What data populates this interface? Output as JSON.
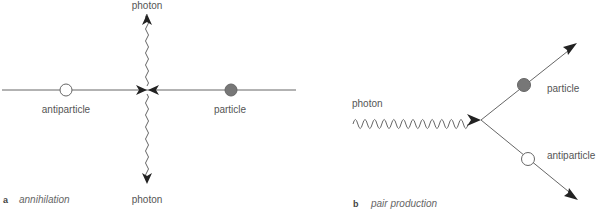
{
  "panels": [
    {
      "id": "a",
      "letter": "a",
      "caption": "annihilation",
      "labels": {
        "photon_top": "photon",
        "photon_bottom": "photon",
        "antiparticle": "antiparticle",
        "particle": "particle"
      },
      "particles": [
        {
          "name": "antiparticle",
          "fill": "#ffffff"
        },
        {
          "name": "particle",
          "fill": "#777777"
        }
      ]
    },
    {
      "id": "b",
      "letter": "b",
      "caption": "pair production",
      "labels": {
        "photon": "photon",
        "particle": "particle",
        "antiparticle": "antiparticle"
      },
      "particles": [
        {
          "name": "particle",
          "fill": "#777777"
        },
        {
          "name": "antiparticle",
          "fill": "#ffffff"
        }
      ]
    }
  ],
  "colors": {
    "line": "#666666",
    "arrowhead": "#222222",
    "particle_fill": "#777777",
    "antiparticle_fill": "#ffffff",
    "label": "#555555"
  }
}
